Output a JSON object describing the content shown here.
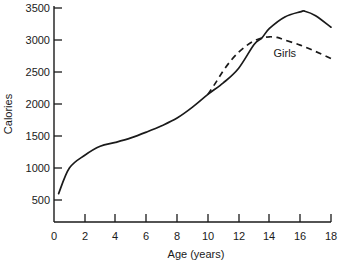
{
  "chart_data": {
    "type": "line",
    "title": "",
    "xlabel": "Age (years)",
    "ylabel": "Calories",
    "xlim": [
      0,
      18
    ],
    "ylim": [
      0,
      3500
    ],
    "grid": false,
    "legend_position": "inline-annotation",
    "x_ticks": [
      "0",
      "2",
      "4",
      "6",
      "8",
      "10",
      "12",
      "14",
      "16",
      "18"
    ],
    "x_tick_values": [
      0,
      2,
      4,
      6,
      8,
      10,
      12,
      14,
      16,
      18
    ],
    "y_ticks": [
      "500",
      "1000",
      "1500",
      "2000",
      "2500",
      "3000",
      "3500"
    ],
    "y_tick_values": [
      500,
      1000,
      1500,
      2000,
      2500,
      3000,
      3500
    ],
    "annotations": [
      {
        "text": "Girls",
        "x": 15.0,
        "y": 2800
      }
    ],
    "series": [
      {
        "name": "Boys",
        "style": "solid",
        "color": "#1a1a1a",
        "x": [
          0.3,
          1,
          2,
          3,
          4,
          5,
          6,
          7,
          8,
          9,
          10,
          11,
          12,
          13,
          13.5,
          14,
          15,
          16,
          16.3,
          17,
          18
        ],
        "values": [
          600,
          1000,
          1200,
          1340,
          1400,
          1470,
          1560,
          1660,
          1780,
          1950,
          2150,
          2330,
          2560,
          2930,
          3030,
          3180,
          3360,
          3440,
          3450,
          3380,
          3200
        ]
      },
      {
        "name": "Girls",
        "style": "dashed",
        "color": "#1a1a1a",
        "x": [
          10,
          10.5,
          11,
          11.5,
          12,
          12.5,
          13,
          13.5,
          14,
          14.5,
          15,
          16,
          17,
          18
        ],
        "values": [
          2150,
          2330,
          2520,
          2680,
          2810,
          2910,
          2985,
          3030,
          3050,
          3040,
          3000,
          2920,
          2820,
          2710
        ]
      }
    ]
  },
  "labels": {
    "x_axis_title": "Age (years)",
    "y_axis_title": "Calories",
    "girls_label": "Girls",
    "x_0": "0",
    "x_2": "2",
    "x_4": "4",
    "x_6": "6",
    "x_8": "8",
    "x_10": "10",
    "x_12": "12",
    "x_14": "14",
    "x_16": "16",
    "x_18": "18",
    "y_500": "500",
    "y_1000": "1000",
    "y_1500": "1500",
    "y_2000": "2000",
    "y_2500": "2500",
    "y_3000": "3000",
    "y_3500": "3500"
  }
}
